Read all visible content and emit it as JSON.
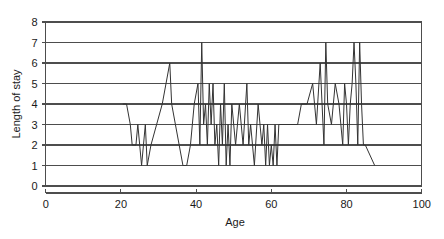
{
  "chart_data": {
    "type": "line",
    "title": "",
    "xlabel": "Age",
    "ylabel": "Length of stay",
    "xlim": [
      0,
      100
    ],
    "ylim": [
      0,
      8
    ],
    "xticks": [
      0,
      20,
      40,
      60,
      80,
      100
    ],
    "yticks": [
      0,
      1,
      2,
      3,
      4,
      5,
      6,
      7,
      8
    ],
    "xtick_labels": [
      "0",
      "20",
      "40",
      "60",
      "80",
      "100"
    ],
    "ytick_labels": [
      "0",
      "1",
      "2",
      "3",
      "4",
      "5",
      "6",
      "7",
      "8"
    ],
    "grid": "horizontal",
    "legend": "none",
    "series": [
      {
        "name": "Length of stay",
        "x": [
          20.5,
          21.5,
          22.5,
          23.0,
          23.5,
          24.0,
          24.5,
          25.0,
          25.5,
          26.0,
          26.5,
          27.0,
          28.0,
          29.5,
          31.0,
          32.0,
          33.0,
          33.5,
          34.5,
          35.5,
          36.5,
          37.5,
          38.5,
          39.5,
          40.5,
          41.0,
          41.5,
          42.0,
          42.5,
          43.0,
          43.5,
          44.0,
          44.5,
          45.0,
          45.5,
          46.0,
          46.5,
          47.0,
          47.5,
          48.0,
          48.5,
          49.0,
          49.5,
          50.5,
          51.5,
          52.5,
          53.5,
          54.0,
          54.5,
          55.0,
          55.5,
          56.5,
          57.5,
          58.0,
          58.5,
          59.0,
          59.5,
          60.0,
          60.5,
          61.0,
          61.5,
          62.0,
          65.0,
          67.0,
          68.0,
          69.5,
          71.0,
          72.0,
          73.0,
          74.0,
          74.5,
          75.0,
          76.0,
          77.0,
          78.0,
          79.0,
          79.5,
          80.0,
          80.5,
          81.0,
          81.5,
          82.0,
          82.5,
          83.0,
          83.5,
          84.0,
          84.5,
          85.0,
          87.5
        ],
        "y": [
          4,
          4,
          3,
          2,
          2,
          2,
          3,
          2,
          1,
          2,
          3,
          1,
          2,
          3,
          4,
          5,
          6,
          4,
          3,
          2,
          1,
          1,
          2,
          4,
          5,
          2,
          7,
          3,
          4,
          2,
          5,
          3,
          5,
          2,
          3,
          1,
          4,
          2,
          5,
          1,
          3,
          1,
          4,
          2,
          4,
          2,
          5,
          2,
          3,
          2,
          1,
          4,
          2,
          3,
          1,
          3,
          1,
          2,
          1,
          3,
          1,
          3,
          3,
          3,
          4,
          4,
          5,
          3,
          6,
          2,
          7,
          4,
          3,
          5,
          4,
          2,
          5,
          4,
          2,
          4,
          5,
          7,
          5,
          2,
          7,
          4,
          2,
          2,
          1
        ]
      }
    ]
  },
  "geometry": {
    "plot_left": 45.7,
    "plot_right": 421.7,
    "plot_top": 22,
    "plot_bottom": 186
  }
}
